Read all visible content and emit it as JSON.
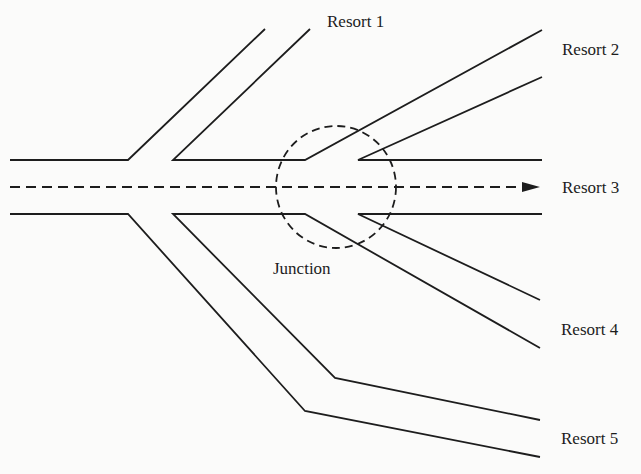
{
  "diagram": {
    "type": "road-network",
    "labels": {
      "resort1": "Resort 1",
      "resort2": "Resort 2",
      "resort3": "Resort 3",
      "resort4": "Resort 4",
      "resort5": "Resort 5",
      "junction": "Junction"
    },
    "colors": {
      "line": "#1d1d1d",
      "background": "#fbfbfa"
    },
    "elements": {
      "main_road": "Horizontal two-line road from the left edge, splitting into branches",
      "center_route": "Dashed arrow along the road centre pointing to Resort 3",
      "junction_marker": "Dashed circle around the split point"
    }
  }
}
